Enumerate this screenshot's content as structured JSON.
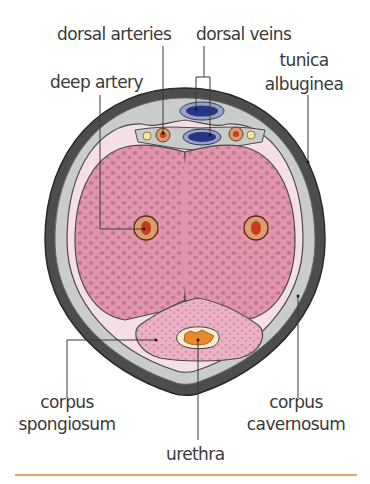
{
  "diagram": {
    "labels": {
      "dorsal_arteries": "dorsal arteries",
      "dorsal_veins": "dorsal veins",
      "deep_artery": "deep artery",
      "tunica_albuginea_line1": "tunica",
      "tunica_albuginea_line2": "albuginea",
      "corpus_spongiosum_line1": "corpus",
      "corpus_spongiosum_line2": "spongiosum",
      "urethra": "urethra",
      "corpus_cavernosum_line1": "corpus",
      "corpus_cavernosum_line2": "cavernosum"
    },
    "colors": {
      "skin_outer": "#4a4a4a",
      "fascia_gray": "#c9cbcb",
      "fascia_pink": "#f2dde3",
      "erectile_tissue": "#e08fa8",
      "sinusoid_spots": "#b8708e",
      "vein": "#2c3a8c",
      "artery_outer": "#d9a070",
      "artery_inner": "#d0381e",
      "nerve": "#f0e68c",
      "urethra": "#e88a2a",
      "leader_line": "#3a3a3a",
      "rule": "#f2a25a"
    }
  }
}
